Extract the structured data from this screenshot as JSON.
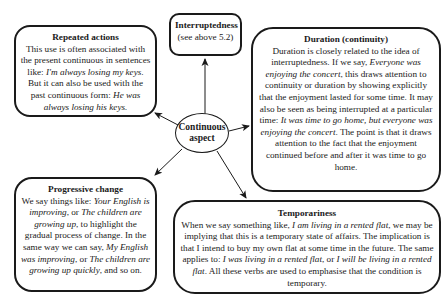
{
  "center": {
    "line1": "Continuous",
    "line2": "aspect"
  },
  "repeated": {
    "title": "Repeated actions",
    "segments": [
      {
        "t": "This use is often associated with the present continuous in sentences like: "
      },
      {
        "t": "I'm always losing my keys",
        "i": true
      },
      {
        "t": ". But it can also be used with the past continuous form: "
      },
      {
        "t": "He was always losing his keys.",
        "i": true
      }
    ]
  },
  "interrupt": {
    "title": "Interruptedness",
    "body": "(see above 5.2)"
  },
  "duration": {
    "title": "Duration (continuity)",
    "segments": [
      {
        "t": "Duration is closely related to the idea of interruptedness. If we say, "
      },
      {
        "t": "Everyone was enjoying the concert",
        "i": true
      },
      {
        "t": ", this draws attention to continuity or duration by showing explicitly that the enjoyment lasted for some time. It may also be seen as being interrupted at a particular time: "
      },
      {
        "t": "It was time to go home, but everyone was enjoying the concert",
        "i": true
      },
      {
        "t": ". The point is that it draws attention to the fact that the enjoyment continued before and after it was time to go home."
      }
    ]
  },
  "progressive": {
    "title": "Progressive change",
    "segments": [
      {
        "t": "We say things like: "
      },
      {
        "t": "Your English is improving",
        "i": true
      },
      {
        "t": ", or "
      },
      {
        "t": "The children are growing up",
        "i": true
      },
      {
        "t": ", to highlight the gradual process of change. In the same way we can say, "
      },
      {
        "t": "My English was improving",
        "i": true
      },
      {
        "t": ", or "
      },
      {
        "t": "The children are growing up quickly",
        "i": true
      },
      {
        "t": ", and so on."
      }
    ]
  },
  "temporariness": {
    "title": "Temporariness",
    "segments": [
      {
        "t": "When we say something like, "
      },
      {
        "t": "I am living in a rented flat",
        "i": true
      },
      {
        "t": ", we may be implying that this is a temporary state of affairs. The implication is that I intend to buy my own flat at some time in the future. The same applies to: "
      },
      {
        "t": "I was living in a rented flat",
        "i": true
      },
      {
        "t": ", or "
      },
      {
        "t": "I will be living in a rented flat",
        "i": true
      },
      {
        "t": ". All these verbs are used to emphasise that the condition is temporary."
      }
    ]
  },
  "colors": {
    "stroke": "#1a1a1a",
    "background": "#ffffff"
  }
}
